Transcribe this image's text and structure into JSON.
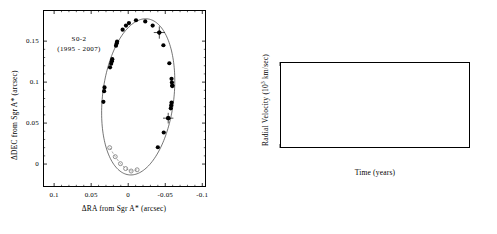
{
  "figure": {
    "caption_star": "S0-2",
    "caption_years": "(1995 - 2007)"
  },
  "chart_data": [
    {
      "type": "scatter",
      "id": "orbit",
      "title": "S0-2 orbit projected on the sky",
      "annotation_line1": "S0-2",
      "annotation_line2": "(1995 - 2007)",
      "xlabel": "ΔRA from Sgr A* (arcsec)",
      "ylabel": "ΔDEC from Sgr A* (arcsec)",
      "xlim": [
        0.115,
        -0.105
      ],
      "ylim": [
        -0.028,
        0.188
      ],
      "xticks": [
        0.1,
        0.05,
        0,
        -0.05,
        -0.1
      ],
      "xticklabels": [
        "0.1",
        "0.05",
        "0",
        "-0.05",
        "-0.1"
      ],
      "yticks": [
        0.15,
        0.1,
        0.05,
        0
      ],
      "yticklabels": [
        "0.15",
        "0.1",
        "0.05",
        "0"
      ],
      "grid": false,
      "legend": "none",
      "axis_direction_note": "RA axis increases to the left",
      "series": [
        {
          "name": "Astrometric measurements",
          "marker": "filled-circle",
          "color": "#000000",
          "points": [
            {
              "x": 0.0335,
              "y": 0.076
            },
            {
              "x": 0.0325,
              "y": 0.089
            },
            {
              "x": 0.032,
              "y": 0.0935
            },
            {
              "x": 0.0245,
              "y": 0.118
            },
            {
              "x": 0.023,
              "y": 0.1225
            },
            {
              "x": 0.022,
              "y": 0.1255
            },
            {
              "x": 0.0215,
              "y": 0.128
            },
            {
              "x": 0.0165,
              "y": 0.1445
            },
            {
              "x": 0.0155,
              "y": 0.1475
            },
            {
              "x": 0.015,
              "y": 0.1495
            },
            {
              "x": 0.0075,
              "y": 0.164
            },
            {
              "x": 0.003,
              "y": 0.169
            },
            {
              "x": -0.001,
              "y": 0.172
            },
            {
              "x": -0.0105,
              "y": 0.1755
            },
            {
              "x": -0.023,
              "y": 0.174
            },
            {
              "x": -0.033,
              "y": 0.169
            },
            {
              "x": -0.042,
              "y": 0.1605
            },
            {
              "x": -0.0475,
              "y": 0.145
            },
            {
              "x": -0.0555,
              "y": 0.123
            },
            {
              "x": -0.0585,
              "y": 0.104
            },
            {
              "x": -0.059,
              "y": 0.0995
            },
            {
              "x": -0.0595,
              "y": 0.0955
            },
            {
              "x": -0.0585,
              "y": 0.075
            },
            {
              "x": -0.058,
              "y": 0.0715
            },
            {
              "x": -0.0575,
              "y": 0.068
            },
            {
              "x": -0.054,
              "y": 0.056
            },
            {
              "x": -0.048,
              "y": 0.0385
            },
            {
              "x": -0.04,
              "y": 0.0205
            }
          ]
        },
        {
          "name": "Points with plotted error bars",
          "marker": "filled-circle-errorbar",
          "color": "#000000",
          "points": [
            {
              "x": -0.042,
              "y": 0.1605,
              "xerr": 0.0075,
              "yerr": 0.0075
            },
            {
              "x": -0.054,
              "y": 0.056,
              "xerr": 0.007,
              "yerr": 0.0065
            },
            {
              "x": -0.0595,
              "y": 0.0955,
              "xerr": 0.003,
              "yerr": 0.003
            }
          ]
        },
        {
          "name": "Pericenter-passage epochs (projected)",
          "marker": "open-circle",
          "color": "#777777",
          "linestyle": "dashed",
          "points": [
            {
              "x": 0.025,
              "y": 0.02
            },
            {
              "x": 0.0175,
              "y": 0.009
            },
            {
              "x": 0.0105,
              "y": 0.0005
            },
            {
              "x": 0.0035,
              "y": -0.0055
            },
            {
              "x": -0.004,
              "y": -0.0085
            },
            {
              "x": -0.012,
              "y": -0.007
            }
          ]
        },
        {
          "name": "Best-fit Keplerian orbit",
          "marker": "none",
          "linestyle": "solid",
          "color": "#333333",
          "ellipse": {
            "center_x": -0.0135,
            "center_y": 0.082,
            "semi_major": 0.096,
            "semi_minor": 0.048,
            "rotation_deg": 8
          }
        }
      ]
    },
    {
      "type": "scatter",
      "id": "radial-velocity",
      "title": "Radial velocity of S0-2 versus time",
      "xlabel": "Time (years)",
      "ylabel": "Radial Velocity (10³ km/sec)",
      "xlim": [
        2000,
        2008
      ],
      "ylim": [
        -2.6,
        5.0
      ],
      "xticks": [
        2000,
        2002,
        2004,
        2006,
        2008
      ],
      "xticklabels": [
        "2000",
        "2002",
        "2004",
        "2006",
        "2008"
      ],
      "yticks": [
        4,
        2,
        0,
        -2
      ],
      "yticklabels": [
        "4",
        "2",
        "0",
        "-2"
      ],
      "grid": false,
      "legend": "none",
      "series": [
        {
          "name": "Radial velocity measurements",
          "marker": "filled-circle",
          "color": "#000000",
          "points": [
            {
              "x": 2000.45,
              "y": 1.1
            },
            {
              "x": 2002.35,
              "y": -0.58
            },
            {
              "x": 2003.3,
              "y": -1.52
            },
            {
              "x": 2003.35,
              "y": -1.5
            },
            {
              "x": 2003.42,
              "y": -1.47
            },
            {
              "x": 2003.45,
              "y": -1.45
            },
            {
              "x": 2004.52,
              "y": -1.16
            },
            {
              "x": 2004.6,
              "y": -1.14
            },
            {
              "x": 2005.45,
              "y": -0.98
            },
            {
              "x": 2006.5,
              "y": -0.78
            },
            {
              "x": 2007.32,
              "y": -0.6
            },
            {
              "x": 2007.55,
              "y": -0.57
            }
          ]
        },
        {
          "name": "Best-fit orbital model",
          "marker": "none",
          "linestyle": "solid",
          "color": "#333333",
          "peak": {
            "x": 2002.31,
            "y": 4.45
          },
          "trough": {
            "x": 2002.72,
            "y": -1.82
          },
          "curve": [
            {
              "x": 2000.0,
              "y": 0.95
            },
            {
              "x": 2000.45,
              "y": 1.12
            },
            {
              "x": 2000.9,
              "y": 1.32
            },
            {
              "x": 2001.3,
              "y": 1.55
            },
            {
              "x": 2001.6,
              "y": 1.8
            },
            {
              "x": 2001.85,
              "y": 2.1
            },
            {
              "x": 2002.0,
              "y": 2.45
            },
            {
              "x": 2002.12,
              "y": 2.9
            },
            {
              "x": 2002.22,
              "y": 3.6
            },
            {
              "x": 2002.28,
              "y": 4.2
            },
            {
              "x": 2002.31,
              "y": 4.45
            },
            {
              "x": 2002.35,
              "y": 3.4
            },
            {
              "x": 2002.4,
              "y": 1.6
            },
            {
              "x": 2002.45,
              "y": 0.1
            },
            {
              "x": 2002.52,
              "y": -1.05
            },
            {
              "x": 2002.6,
              "y": -1.6
            },
            {
              "x": 2002.72,
              "y": -1.82
            },
            {
              "x": 2002.9,
              "y": -1.8
            },
            {
              "x": 2003.2,
              "y": -1.62
            },
            {
              "x": 2003.6,
              "y": -1.42
            },
            {
              "x": 2004.0,
              "y": -1.3
            },
            {
              "x": 2004.6,
              "y": -1.14
            },
            {
              "x": 2005.4,
              "y": -0.97
            },
            {
              "x": 2006.2,
              "y": -0.83
            },
            {
              "x": 2007.0,
              "y": -0.67
            },
            {
              "x": 2008.0,
              "y": -0.5
            }
          ]
        }
      ]
    }
  ]
}
